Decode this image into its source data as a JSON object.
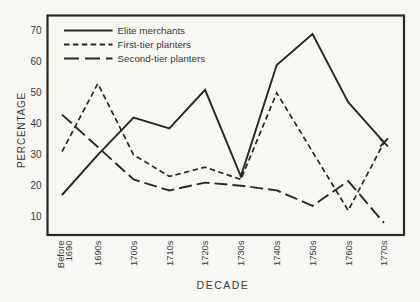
{
  "page": {
    "background": "#f8f7f4",
    "ink": "#282828",
    "text_color": "#3a3a3a"
  },
  "chart_data": {
    "type": "line",
    "title": "",
    "xlabel": "DECADE",
    "ylabel": "PERCENTAGE",
    "categories": [
      "Before 1690",
      "1690s",
      "1700s",
      "1710s",
      "1720s",
      "1730s",
      "1740s",
      "1750s",
      "1760s",
      "1770s"
    ],
    "series": [
      {
        "name": "Elite merchants",
        "line_style": "solid",
        "end_marker": "x",
        "values": [
          17,
          30,
          42,
          38.5,
          51,
          23,
          59,
          69,
          47,
          34
        ]
      },
      {
        "name": "First-tier planters",
        "line_style": "short-dash",
        "end_marker": "x",
        "values": [
          31,
          53,
          30,
          23,
          26,
          22,
          50,
          31,
          12,
          34
        ]
      },
      {
        "name": "Second-tier planters",
        "line_style": "long-dash",
        "end_marker": null,
        "values": [
          43,
          32.5,
          22,
          18.5,
          21,
          20,
          18.5,
          13.5,
          21.5,
          8
        ]
      }
    ],
    "yticks": [
      10,
      20,
      30,
      40,
      50,
      60,
      70
    ],
    "ylim": [
      3.5,
      75
    ],
    "grid": false,
    "legend_position": "top-left"
  }
}
